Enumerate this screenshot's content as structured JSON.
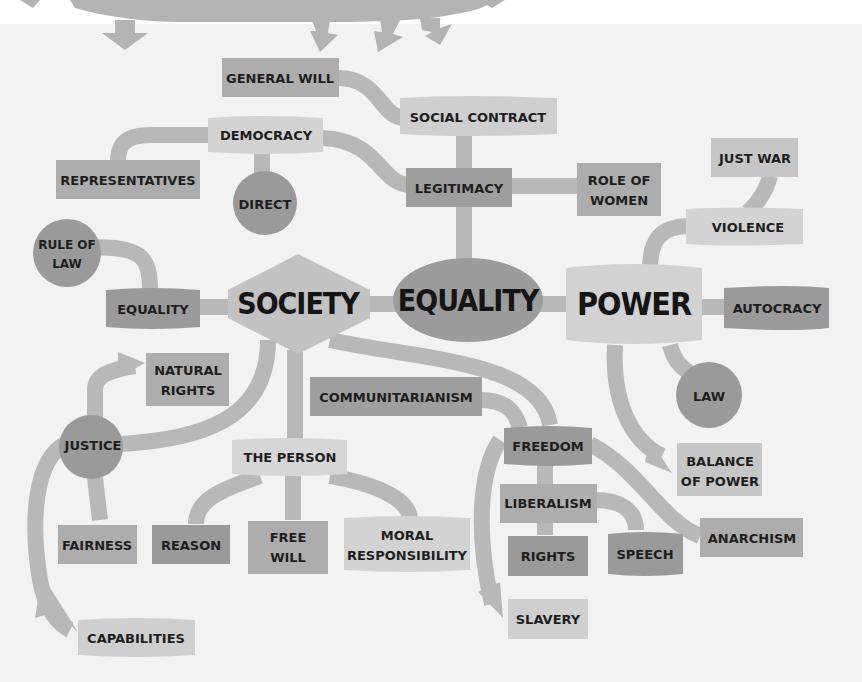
{
  "diagram": {
    "colors": {
      "background": "#f2f2f2",
      "top_background": "#ffffff",
      "connector": "#b8b8b8",
      "light_node": "#d3d3d3",
      "mid_node": "#adadad",
      "dark_node": "#9a9a9a",
      "text": "#1e1e1e"
    },
    "hubs": {
      "society": "SOCIETY",
      "equality": "EQUALITY",
      "power": "POWER"
    },
    "nodes": {
      "general_will": "GENERAL WILL",
      "social_contract": "SOCIAL CONTRACT",
      "democracy": "DEMOCRACY",
      "representatives": "REPRESENTATIVES",
      "direct": "DIRECT",
      "legitimacy": "LEGITIMACY",
      "role_of_women_1": "ROLE OF",
      "role_of_women_2": "WOMEN",
      "just_war": "JUST WAR",
      "violence": "VIOLENCE",
      "rule_of_law_1": "RULE OF",
      "rule_of_law_2": "LAW",
      "equality_small": "EQUALITY",
      "autocracy": "AUTOCRACY",
      "natural_rights_1": "NATURAL",
      "natural_rights_2": "RIGHTS",
      "communitarianism": "COMMUNITARIANISM",
      "law": "LAW",
      "justice": "JUSTICE",
      "the_person": "THE PERSON",
      "freedom": "FREEDOM",
      "balance_of_power_1": "BALANCE",
      "balance_of_power_2": "OF POWER",
      "liberalism": "LIBERALISM",
      "anarchism": "ANARCHISM",
      "fairness": "FAIRNESS",
      "reason": "REASON",
      "free_will_1": "FREE",
      "free_will_2": "WILL",
      "moral_responsibility_1": "MORAL",
      "moral_responsibility_2": "RESPONSIBILITY",
      "rights": "RIGHTS",
      "speech": "SPEECH",
      "slavery": "SLAVERY",
      "capabilities": "CAPABILITIES"
    }
  }
}
